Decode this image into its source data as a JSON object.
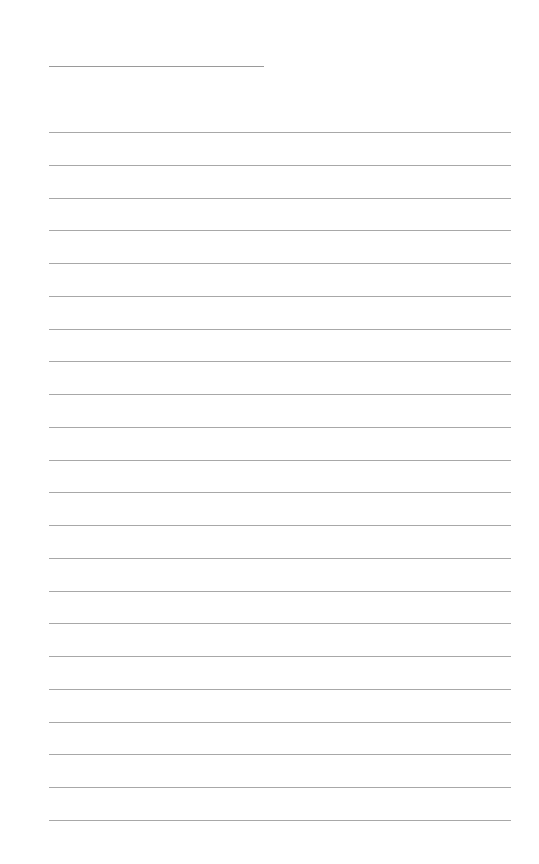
{
  "page": {
    "type": "lined-paper",
    "background": "#ffffff",
    "line_color": "#a8a8a8",
    "header_line": {
      "top": 66,
      "left": 49,
      "width": 215
    },
    "rules": {
      "count": 22,
      "first_top": 132,
      "spacing": 32.75,
      "left": 49,
      "width": 462
    }
  }
}
